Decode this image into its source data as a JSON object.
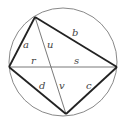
{
  "diagram": {
    "type": "cyclic-quadrilateral-with-diagonals",
    "colors": {
      "background": "#ffffff",
      "circle": "#7a7a7a",
      "sides": "#222222",
      "diagonals": "#6a6a6a",
      "labels": "#444444"
    },
    "circle": {
      "cx": 63,
      "cy": 62,
      "r": 54
    },
    "vertices": {
      "top": {
        "x": 35,
        "y": 17
      },
      "left": {
        "x": 9,
        "y": 67
      },
      "right": {
        "x": 117,
        "y": 67
      },
      "bottom": {
        "x": 66,
        "y": 114
      }
    },
    "labels": {
      "a": "a",
      "b": "b",
      "c": "c",
      "d": "d",
      "u": "u",
      "v": "v",
      "r": "r",
      "s": "s"
    }
  }
}
